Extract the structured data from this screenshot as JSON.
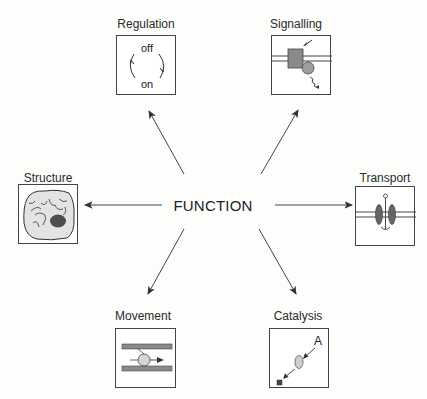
{
  "diagram": {
    "center": {
      "label": "FUNCTION"
    },
    "nodes": [
      {
        "id": "regulation",
        "label": "Regulation",
        "texts": {
          "top": "off",
          "bottom": "on"
        }
      },
      {
        "id": "signalling",
        "label": "Signalling"
      },
      {
        "id": "structure",
        "label": "Structure"
      },
      {
        "id": "transport",
        "label": "Transport"
      },
      {
        "id": "movement",
        "label": "Movement"
      },
      {
        "id": "catalysis",
        "label": "Catalysis",
        "texts": {
          "substrate": "A"
        }
      }
    ],
    "edges": [
      {
        "from": "FUNCTION",
        "to": "Regulation"
      },
      {
        "from": "FUNCTION",
        "to": "Signalling"
      },
      {
        "from": "FUNCTION",
        "to": "Structure"
      },
      {
        "from": "FUNCTION",
        "to": "Transport"
      },
      {
        "from": "FUNCTION",
        "to": "Movement"
      },
      {
        "from": "FUNCTION",
        "to": "Catalysis"
      }
    ],
    "colors": {
      "line": "#333333",
      "fill_dark": "#7a7a7a",
      "fill_mid": "#9a9a9a",
      "fill_light": "#d9d9d9",
      "nucleus": "#555555"
    }
  }
}
